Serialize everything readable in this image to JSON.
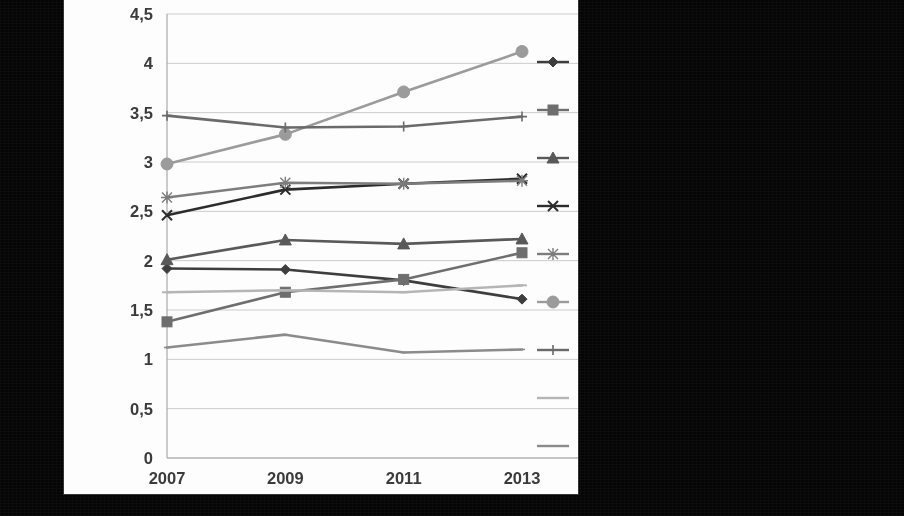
{
  "figure": {
    "background_color": "#050505",
    "panel_color": "#fdfdfd",
    "panel": {
      "x": 64,
      "y": 0,
      "width": 514,
      "height": 494
    }
  },
  "chart_data": {
    "type": "line",
    "title": "",
    "subtitle": "",
    "xlabel": "",
    "ylabel": "",
    "x": [
      "2007",
      "2009",
      "2011",
      "2013"
    ],
    "categories": [
      "2007",
      "2009",
      "2011",
      "2013"
    ],
    "ylim": [
      0,
      4.5
    ],
    "ytick_labels": [
      "0",
      "0,5",
      "1",
      "1,5",
      "2",
      "2,5",
      "3",
      "3,5",
      "4",
      "4,5"
    ],
    "ytick_values": [
      0,
      0.5,
      1,
      1.5,
      2,
      2.5,
      3,
      3.5,
      4,
      4.5
    ],
    "ytick_step": 0.5,
    "decimal_separator": ",",
    "grid": true,
    "grid_axis": "y",
    "legend_position": "right",
    "legend_labels_visible": false,
    "series": [
      {
        "name": "series-1",
        "marker": "diamond",
        "color": "#3f3f3f",
        "legend_index": 0,
        "values": [
          1.92,
          1.91,
          1.8,
          1.61
        ]
      },
      {
        "name": "series-2",
        "marker": "square",
        "color": "#6e6e6e",
        "legend_index": 1,
        "values": [
          1.38,
          1.68,
          1.81,
          2.08
        ]
      },
      {
        "name": "series-3",
        "marker": "triangle",
        "color": "#5a5a5a",
        "legend_index": 2,
        "values": [
          2.01,
          2.21,
          2.17,
          2.22
        ]
      },
      {
        "name": "series-4",
        "marker": "cross",
        "color": "#2e2e2e",
        "legend_index": 3,
        "values": [
          2.46,
          2.72,
          2.78,
          2.83
        ]
      },
      {
        "name": "series-5",
        "marker": "star",
        "color": "#7d7d7d",
        "legend_index": 4,
        "values": [
          2.64,
          2.79,
          2.78,
          2.81
        ]
      },
      {
        "name": "series-6",
        "marker": "circle",
        "color": "#9a9a9a",
        "legend_index": 5,
        "values": [
          2.98,
          3.28,
          3.71,
          4.12
        ]
      },
      {
        "name": "series-7",
        "marker": "plus",
        "color": "#6a6a6a",
        "legend_index": 6,
        "values": [
          3.47,
          3.35,
          3.36,
          3.46
        ]
      },
      {
        "name": "series-8",
        "marker": "dash",
        "color": "#b4b4b4",
        "legend_index": 7,
        "values": [
          1.68,
          1.7,
          1.68,
          1.75
        ]
      },
      {
        "name": "series-9",
        "marker": "line",
        "color": "#8b8b8b",
        "legend_index": 8,
        "values": [
          1.12,
          1.25,
          1.07,
          1.1
        ]
      }
    ]
  },
  "legend": {
    "items": [
      {
        "marker": "diamond",
        "color": "#3f3f3f",
        "label": ""
      },
      {
        "marker": "square",
        "color": "#6e6e6e",
        "label": ""
      },
      {
        "marker": "triangle",
        "color": "#5a5a5a",
        "label": ""
      },
      {
        "marker": "cross",
        "color": "#2e2e2e",
        "label": ""
      },
      {
        "marker": "star",
        "color": "#7d7d7d",
        "label": ""
      },
      {
        "marker": "circle",
        "color": "#9a9a9a",
        "label": ""
      },
      {
        "marker": "plus",
        "color": "#6a6a6a",
        "label": ""
      },
      {
        "marker": "dash",
        "color": "#b4b4b4",
        "label": ""
      },
      {
        "marker": "line",
        "color": "#8b8b8b",
        "label": ""
      }
    ]
  }
}
